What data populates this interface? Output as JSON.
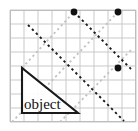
{
  "figure": {
    "width": 138,
    "height": 131,
    "background_color": "#ffffff"
  },
  "grid": {
    "name": "square-grid",
    "line_color": "#c9c9c9",
    "border_color": "#bdbdbd",
    "origin_x": 10,
    "origin_y": 10,
    "cell_size": 14,
    "columns": 9,
    "rows": 8
  },
  "object": {
    "label": "object",
    "shape": "right-triangle",
    "stroke_color": "#1a1a1a",
    "stroke_width": 2.1,
    "vertices": [
      {
        "x": 22,
        "y": 68
      },
      {
        "x": 22,
        "y": 113
      },
      {
        "x": 78,
        "y": 113
      }
    ],
    "label_position": {
      "x": 24,
      "y": 109
    }
  },
  "rays": {
    "dark_dashed": {
      "name": "incident-rays",
      "color": "#1b1b1b",
      "dash": "2.4 3.2",
      "width": 1.9,
      "lines": [
        {
          "x1": 28,
          "y1": 25,
          "x2": 124,
          "y2": 121
        },
        {
          "x1": 74,
          "y1": 12,
          "x2": 131,
          "y2": 69
        }
      ]
    },
    "light_dashed": {
      "name": "reflected-rays",
      "color": "#c2c2c2",
      "dash": "2.2 3.0",
      "width": 1.8,
      "lines": [
        {
          "x1": 12,
          "y1": 122,
          "x2": 118,
          "y2": 12
        },
        {
          "x1": 22,
          "y1": 68,
          "x2": 74,
          "y2": 12
        },
        {
          "x1": 60,
          "y1": 122,
          "x2": 131,
          "y2": 50
        }
      ]
    }
  },
  "points": {
    "name": "image-points",
    "color": "#111111",
    "radius": 3.4,
    "items": [
      {
        "id": "point-top-left",
        "x": 74,
        "y": 12
      },
      {
        "id": "point-top-right",
        "x": 118,
        "y": 12
      },
      {
        "id": "point-right",
        "x": 118,
        "y": 68
      }
    ]
  }
}
